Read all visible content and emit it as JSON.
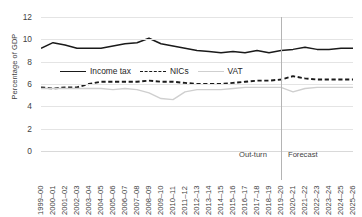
{
  "chart_data": {
    "type": "line",
    "title": "",
    "xlabel": "",
    "ylabel": "Percentage of GDP",
    "ylim": [
      0,
      12
    ],
    "ytick_values": [
      0,
      2,
      4,
      6,
      8,
      10,
      12
    ],
    "ytick_labels": [
      "0",
      "2",
      "4",
      "6",
      "8",
      "10",
      "12"
    ],
    "grid": true,
    "legend_position": "inside-upper-left",
    "categories": [
      "1999–00",
      "2000–01",
      "2001–02",
      "2002–03",
      "2003–04",
      "2004–05",
      "2005–06",
      "2006–07",
      "2007–08",
      "2008–09",
      "2009–10",
      "2010–11",
      "2011–12",
      "2012–13",
      "2013–14",
      "2014–15",
      "2015–16",
      "2016–17",
      "2017–18",
      "2018–19",
      "2019–20",
      "2020–21",
      "2021–22",
      "2022–23",
      "2023–24",
      "2024–25",
      "2025–26"
    ],
    "series": [
      {
        "name": "Income tax",
        "style": "solid",
        "color": "#1a1a1a",
        "values": [
          9.2,
          9.7,
          9.5,
          9.2,
          9.2,
          9.2,
          9.4,
          9.6,
          9.7,
          10.1,
          9.6,
          9.4,
          9.2,
          9.0,
          8.9,
          8.8,
          8.9,
          8.8,
          9.0,
          8.8,
          9.0,
          9.1,
          9.3,
          9.1,
          9.1,
          9.2,
          9.2
        ]
      },
      {
        "name": "NICs",
        "style": "dashed",
        "color": "#1a1a1a",
        "values": [
          5.7,
          5.6,
          5.7,
          5.7,
          6.0,
          6.2,
          6.2,
          6.2,
          6.2,
          6.3,
          6.2,
          6.2,
          6.1,
          6.0,
          6.0,
          6.0,
          6.1,
          6.2,
          6.3,
          6.3,
          6.4,
          6.7,
          6.5,
          6.4,
          6.4,
          6.4,
          6.4
        ]
      },
      {
        "name": "VAT",
        "style": "solid",
        "color": "#cfcfcf",
        "values": [
          5.6,
          5.6,
          5.6,
          5.6,
          5.6,
          5.6,
          5.5,
          5.6,
          5.5,
          5.2,
          4.7,
          4.6,
          5.3,
          5.5,
          5.5,
          5.5,
          5.6,
          5.7,
          5.7,
          5.7,
          5.7,
          5.3,
          5.6,
          5.7,
          5.7,
          5.7,
          5.7
        ]
      }
    ],
    "annotations": [
      {
        "text": "Out-turn",
        "align": "right-of-left-region"
      },
      {
        "text": "Forecast",
        "align": "left-of-right-region"
      }
    ],
    "divider": {
      "after_category": "2019–20",
      "color": "#b4b4b4"
    }
  }
}
